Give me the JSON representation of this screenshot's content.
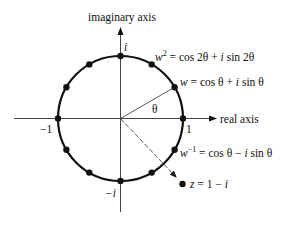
{
  "diagram": {
    "axes": {
      "imaginary_label": "imaginary axis",
      "real_label": "real axis"
    },
    "tick_labels": {
      "i": "i",
      "minus_i": "−i",
      "one": "1",
      "minus_one": "−1"
    },
    "angle_label": "θ",
    "annotations": {
      "w2": {
        "base": "w",
        "exp": "2",
        "rest": " = cos 2θ + ",
        "i": "i",
        "tail": " sin 2θ"
      },
      "w": {
        "base": "w",
        "rest": " = cos θ + ",
        "i": "i",
        "tail": " sin θ"
      },
      "winv": {
        "base": "w",
        "exp": "−1",
        "rest": " = cos θ − ",
        "i": "i",
        "tail": " sin θ"
      },
      "z": {
        "base": "z",
        "rest": " = 1 − ",
        "i": "i"
      }
    },
    "points_on_circle_count": 12,
    "colors": {
      "ink": "#111111",
      "axis": "#444444"
    }
  }
}
